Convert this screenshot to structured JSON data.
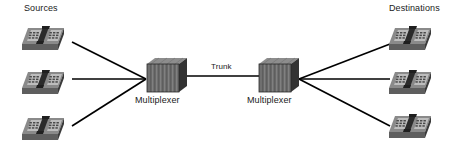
{
  "diagram": {
    "labels": {
      "sources": "Sources",
      "destinations": "Destinations",
      "trunk": "Trunk",
      "multiplexer_left": "Multiplexer",
      "multiplexer_right": "Multiplexer"
    },
    "colors": {
      "background": "#ffffff",
      "line": "#000000",
      "text": "#1a1a1a",
      "device_top": "#808080",
      "device_front": "#6e6e6e",
      "device_side": "#3d3d3d",
      "device_keypad": "#b5b5b5",
      "device_handset": "#2b2b2b"
    },
    "nodes": {
      "sources": [
        {
          "name": "source-phone-1",
          "type": "telephone",
          "x": 18,
          "y": 22
        },
        {
          "name": "source-phone-2",
          "type": "telephone",
          "x": 18,
          "y": 66
        },
        {
          "name": "source-phone-3",
          "type": "telephone",
          "x": 18,
          "y": 112
        }
      ],
      "destinations": [
        {
          "name": "destination-phone-1",
          "type": "telephone",
          "x": 385,
          "y": 22
        },
        {
          "name": "destination-phone-2",
          "type": "telephone",
          "x": 385,
          "y": 66
        },
        {
          "name": "destination-phone-3",
          "type": "telephone",
          "x": 385,
          "y": 110
        }
      ],
      "multiplexers": [
        {
          "name": "multiplexer-left",
          "type": "multiplexer",
          "x": 145,
          "y": 57
        },
        {
          "name": "multiplexer-right",
          "type": "multiplexer",
          "x": 257,
          "y": 57
        }
      ]
    },
    "links": [
      {
        "name": "link-source-1",
        "from": "source-phone-1",
        "to": "multiplexer-left",
        "x1": 72,
        "y1": 42,
        "x2": 146,
        "y2": 79
      },
      {
        "name": "link-source-2",
        "from": "source-phone-2",
        "to": "multiplexer-left",
        "x1": 72,
        "y1": 79,
        "x2": 146,
        "y2": 79
      },
      {
        "name": "link-source-3",
        "from": "source-phone-3",
        "to": "multiplexer-left",
        "x1": 72,
        "y1": 126,
        "x2": 146,
        "y2": 79
      },
      {
        "name": "link-trunk",
        "from": "multiplexer-left",
        "to": "multiplexer-right",
        "x1": 188,
        "y1": 76,
        "x2": 259,
        "y2": 76
      },
      {
        "name": "link-destination-1",
        "from": "multiplexer-right",
        "to": "destination-phone-1",
        "x1": 299,
        "y1": 79,
        "x2": 390,
        "y2": 44
      },
      {
        "name": "link-destination-2",
        "from": "multiplexer-right",
        "to": "destination-phone-2",
        "x1": 299,
        "y1": 79,
        "x2": 390,
        "y2": 79
      },
      {
        "name": "link-destination-3",
        "from": "multiplexer-right",
        "to": "destination-phone-3",
        "x1": 299,
        "y1": 79,
        "x2": 390,
        "y2": 126
      }
    ]
  }
}
